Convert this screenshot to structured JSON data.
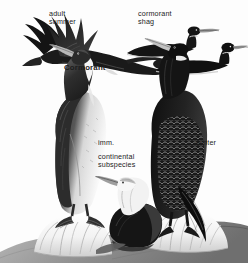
{
  "plate": {
    "title": "Cormorant",
    "background_color": "#fdfdfd",
    "ink_color": "#1c1c1c",
    "labels": {
      "adult_summer": "adult\nsummer",
      "cormorant_shag": "cormorant\nshag",
      "title": "Cormorant",
      "imm": "imm.",
      "continental_subspecies": "continental\nsubspecies",
      "winter": "winter"
    },
    "figures": [
      {
        "name": "flying-cormorant",
        "pose": "in flight, wings raised",
        "label": "adult summer"
      },
      {
        "name": "swimming-cormorant-rear",
        "pose": "swimming silhouette",
        "label": "cormorant shag"
      },
      {
        "name": "swimming-cormorant-front",
        "pose": "swimming silhouette",
        "label": "cormorant shag"
      },
      {
        "name": "standing-cormorant-immature",
        "pose": "perched on guano rock, white breast",
        "label": "imm."
      },
      {
        "name": "standing-cormorant-winter",
        "pose": "perched on guano rock, dark scaled plumage",
        "label": "winter"
      },
      {
        "name": "resting-cormorant-continental",
        "pose": "head and neck, foreground",
        "label": "continental subspecies"
      }
    ]
  }
}
